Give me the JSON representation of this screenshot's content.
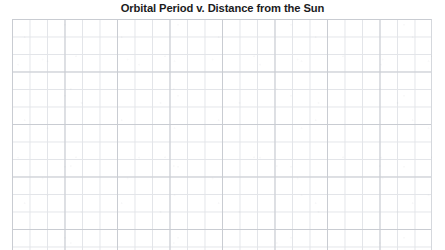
{
  "chart_data": {
    "type": "scatter",
    "title": "Orbital Period v. Distance from the Sun",
    "subtitle": "",
    "xlabel": "",
    "ylabel": "",
    "x": [],
    "y": [],
    "series": [],
    "categories": [],
    "values": [],
    "xticklabels": [],
    "yticklabels": [],
    "legend_entries": [],
    "annotations": [],
    "grid": true,
    "grid_style": "graph-paper",
    "grid_minor_cell_px": 17.5,
    "grid_major_every_n_cells": 3,
    "plot_is_blank": true,
    "legend_position": "none"
  },
  "page": {
    "title": "Orbital Period v. Distance from the Sun",
    "background_color": "#ffffff"
  },
  "plot": {
    "description": "Blank graph paper plotting grid",
    "minor_line_color": "#e3e5e9",
    "major_line_color": "#c9ccd2",
    "background_color": "#ffffff"
  }
}
